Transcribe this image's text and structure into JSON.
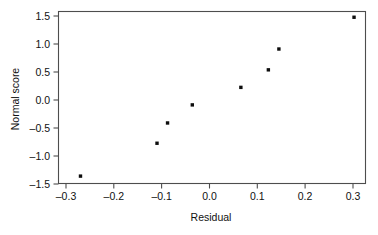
{
  "chart_data": {
    "type": "scatter",
    "title": "",
    "xlabel": "Residual",
    "ylabel": "Normal score",
    "xlim": [
      -0.345,
      0.325
    ],
    "ylim": [
      -1.575,
      1.565
    ],
    "grid": false,
    "legend": null,
    "xticks": [
      -0.3,
      -0.2,
      -0.1,
      0.0,
      0.1,
      0.2,
      0.3
    ],
    "xtick_labels": [
      "–0.3",
      "–0.2",
      "–0.1",
      "0.0",
      "0.1",
      "0.2",
      "0.3"
    ],
    "yticks": [
      1.5,
      1.0,
      0.5,
      0.0,
      -0.5,
      -1.0,
      -1.5
    ],
    "ytick_labels": [
      "1.5",
      "1.0",
      "0.5",
      "0.0",
      "–0.5",
      "–1.0",
      "–1.5"
    ],
    "marker": "square",
    "marker_size": 3.4,
    "marker_color": "#0d0d0d",
    "points": [
      {
        "x": -0.297,
        "y": -1.44
      },
      {
        "x": -0.13,
        "y": -0.84
      },
      {
        "x": -0.107,
        "y": -0.47
      },
      {
        "x": -0.053,
        "y": -0.14
      },
      {
        "x": 0.053,
        "y": 0.18
      },
      {
        "x": 0.113,
        "y": 0.5
      },
      {
        "x": 0.136,
        "y": 0.88
      },
      {
        "x": 0.3,
        "y": 1.46
      }
    ],
    "x": [
      -0.297,
      -0.13,
      -0.107,
      -0.053,
      0.053,
      0.113,
      0.136,
      0.3
    ],
    "values": [
      -1.44,
      -0.84,
      -0.47,
      -0.14,
      0.18,
      0.5,
      0.88,
      1.46
    ]
  },
  "figure": {
    "background_color": "#ffffff",
    "axis_color": "#4d4d4d",
    "text_color": "#111111"
  }
}
